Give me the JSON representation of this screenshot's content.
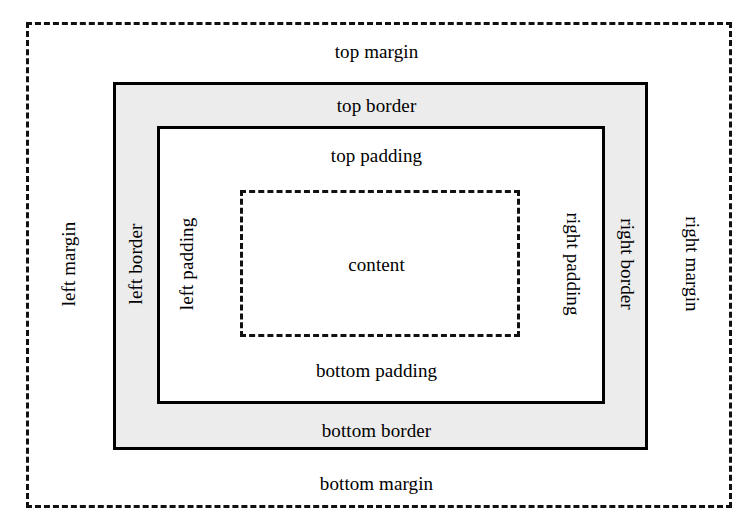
{
  "diagram": {
    "colors": {
      "border_band_fill": "#ececec",
      "box_fill": "#ffffff",
      "line": "#000000",
      "dashed_line": "#111111",
      "text": "#000000",
      "background": "#ffffff"
    },
    "boxes": [
      {
        "name": "margin-box",
        "stroke": "dashed",
        "fill": "#ffffff",
        "x": 26,
        "y": 22,
        "width": 706,
        "height": 486
      },
      {
        "name": "border-box",
        "stroke": "solid",
        "fill": "#ececec",
        "x": 113,
        "y": 82,
        "width": 535,
        "height": 368
      },
      {
        "name": "padding-box",
        "stroke": "solid",
        "fill": "#ffffff",
        "x": 157,
        "y": 126,
        "width": 448,
        "height": 278
      },
      {
        "name": "content-box",
        "stroke": "dashed",
        "fill": "#ffffff",
        "x": 240,
        "y": 190,
        "width": 280,
        "height": 147
      }
    ],
    "labels": {
      "top_margin": "top margin",
      "top_border": "top border",
      "top_padding": "top padding",
      "content": "content",
      "bottom_padding": "bottom padding",
      "bottom_border": "bottom border",
      "bottom_margin": "bottom margin",
      "left_margin": "left margin",
      "left_border": "left border",
      "left_padding": "left padding",
      "right_padding": "right padding",
      "right_border": "right border",
      "right_margin": "right margin"
    }
  }
}
